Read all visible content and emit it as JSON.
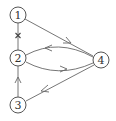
{
  "diagram": {
    "type": "directed-graph",
    "nodes": [
      {
        "id": "1",
        "label": "1",
        "x": 18,
        "y": 15
      },
      {
        "id": "2",
        "label": "2",
        "x": 18,
        "y": 58
      },
      {
        "id": "3",
        "label": "3",
        "x": 18,
        "y": 105
      },
      {
        "id": "4",
        "label": "4",
        "x": 101,
        "y": 60
      }
    ],
    "edges": [
      {
        "from": "1",
        "to": "4",
        "style": "straight"
      },
      {
        "from": "4",
        "to": "2",
        "style": "curved-upper"
      },
      {
        "from": "2",
        "to": "4",
        "style": "curved-lower"
      },
      {
        "from": "4",
        "to": "3",
        "style": "straight"
      },
      {
        "from": "3",
        "to": "2",
        "style": "straight"
      },
      {
        "from": "1",
        "to": "2",
        "style": "blocked",
        "marker": "×"
      }
    ],
    "colors": {
      "stroke": "#666666",
      "node_stroke": "#555555",
      "text": "#333333",
      "background": "#ffffff"
    }
  }
}
